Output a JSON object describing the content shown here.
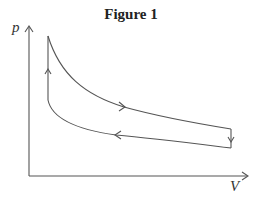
{
  "figure": {
    "title": "Figure 1",
    "y_axis_label": "p",
    "x_axis_label": "V"
  },
  "diagram": {
    "type": "pV cycle",
    "processes": [
      {
        "name": "isochoric-pressure-rise",
        "direction": "up",
        "location": "left vertical"
      },
      {
        "name": "expansion",
        "direction": "right",
        "location": "upper curve"
      },
      {
        "name": "isochoric-pressure-drop",
        "direction": "down",
        "location": "right vertical"
      },
      {
        "name": "compression",
        "direction": "left",
        "location": "lower curve"
      }
    ],
    "line_color": "#555555"
  }
}
